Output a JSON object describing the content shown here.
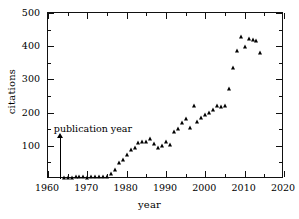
{
  "chart_data": {
    "type": "scatter",
    "title": "",
    "xlabel": "year",
    "ylabel": "citations",
    "xlim": [
      1960,
      2020
    ],
    "ylim": [
      0,
      500
    ],
    "xticks": [
      1960,
      1970,
      1980,
      1990,
      2000,
      2010,
      2020
    ],
    "xtick_labels": [
      "1960",
      "1970",
      "1980",
      "1990",
      "2000",
      "2010",
      "2020"
    ],
    "xminor_ticks": [
      1965,
      1975,
      1985,
      1995,
      2005,
      2015
    ],
    "yticks": [
      100,
      200,
      300,
      400,
      500
    ],
    "ytick_labels": [
      "100",
      "200",
      "300",
      "400",
      "500"
    ],
    "yminor_ticks": [
      50,
      150,
      250,
      350,
      450
    ],
    "grid": false,
    "legend": null,
    "marker": "triangle-up",
    "marker_color": "#000000",
    "series": [
      {
        "name": "citations per year",
        "x": [
          1964,
          1965,
          1966,
          1967,
          1968,
          1969,
          1970,
          1971,
          1972,
          1973,
          1974,
          1975,
          1976,
          1977,
          1978,
          1979,
          1980,
          1981,
          1982,
          1983,
          1984,
          1985,
          1986,
          1987,
          1988,
          1989,
          1990,
          1991,
          1992,
          1993,
          1994,
          1995,
          1996,
          1997,
          1998,
          1999,
          2000,
          2001,
          2002,
          2003,
          2004,
          2005,
          2006,
          2007,
          2008,
          2009,
          2010,
          2011,
          2012,
          2013,
          2014
        ],
        "y": [
          3,
          4,
          4,
          5,
          5,
          5,
          4,
          6,
          7,
          6,
          5,
          6,
          14,
          27,
          48,
          57,
          72,
          88,
          93,
          107,
          110,
          110,
          121,
          105,
          93,
          100,
          110,
          101,
          143,
          152,
          168,
          181,
          155,
          220,
          172,
          184,
          193,
          199,
          207,
          219,
          218,
          219,
          271,
          334,
          386,
          427,
          397,
          421,
          418,
          416,
          379
        ]
      }
    ],
    "annotations": [
      {
        "name": "publication-year",
        "text": "publication year",
        "x": 1963,
        "arrow_from_y": 0,
        "arrow_to_y": 122,
        "text_y": 152
      }
    ]
  }
}
